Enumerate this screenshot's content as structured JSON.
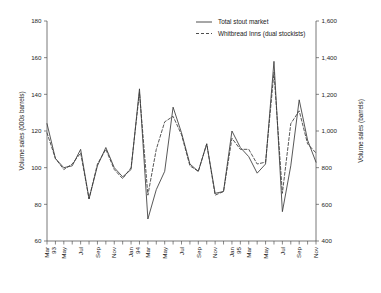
{
  "chart_data": {
    "type": "line",
    "title": "",
    "xlabel": "",
    "ylabel": "Volume sales (000s barrels)",
    "y2label": "Volume sales (barrels)",
    "ylim": [
      60,
      180
    ],
    "y2lim": [
      400,
      1600
    ],
    "yticks": [
      "60",
      "80",
      "100",
      "120",
      "140",
      "160",
      "180"
    ],
    "ytick_values": [
      60,
      80,
      100,
      120,
      140,
      160,
      180
    ],
    "y2ticks": [
      "400",
      "600",
      "800",
      "1,000",
      "1,200",
      "1,400",
      "1,600"
    ],
    "y2tick_values": [
      400,
      600,
      800,
      1000,
      1200,
      1400,
      1600
    ],
    "grid": false,
    "legend_position": "top-right",
    "x": [
      "Mar 93",
      "Apr 93",
      "May 93",
      "Jun 93",
      "Jul 93",
      "Aug 93",
      "Sep 93",
      "Oct 93",
      "Nov 93",
      "Dec 93",
      "Jan 94",
      "Feb 94",
      "Mar 94",
      "Apr 94",
      "May 94",
      "Jun 94",
      "Jul 94",
      "Aug 94",
      "Sep 94",
      "Oct 94",
      "Nov 94",
      "Dec 94",
      "Jan 95",
      "Feb 95",
      "Mar 95",
      "Apr 95",
      "May 95",
      "Jun 95",
      "Jul 95",
      "Aug 95",
      "Sep 95",
      "Oct 95",
      "Nov 95"
    ],
    "xtick_labels": [
      {
        "index": 0,
        "line1": "Mar",
        "line2": "93"
      },
      {
        "index": 2,
        "line1": "May",
        "line2": ""
      },
      {
        "index": 4,
        "line1": "Jul",
        "line2": ""
      },
      {
        "index": 6,
        "line1": "Sep",
        "line2": ""
      },
      {
        "index": 8,
        "line1": "Nov",
        "line2": ""
      },
      {
        "index": 10,
        "line1": "Jan",
        "line2": "94"
      },
      {
        "index": 12,
        "line1": "Mar",
        "line2": ""
      },
      {
        "index": 14,
        "line1": "May",
        "line2": ""
      },
      {
        "index": 16,
        "line1": "Jul",
        "line2": ""
      },
      {
        "index": 18,
        "line1": "Sep",
        "line2": ""
      },
      {
        "index": 20,
        "line1": "Nov",
        "line2": ""
      },
      {
        "index": 22,
        "line1": "Jan",
        "line2": "95"
      },
      {
        "index": 24,
        "line1": "Mar",
        "line2": ""
      },
      {
        "index": 26,
        "line1": "May",
        "line2": ""
      },
      {
        "index": 28,
        "line1": "Jul",
        "line2": ""
      },
      {
        "index": 30,
        "line1": "Sep",
        "line2": ""
      },
      {
        "index": 32,
        "line1": "Nov",
        "line2": ""
      }
    ],
    "series": [
      {
        "name": "Total stout market",
        "style": "solid",
        "color": "#3a3a3a",
        "values": [
          124,
          105,
          100,
          101,
          110,
          83,
          101,
          111,
          100,
          95,
          99,
          143,
          72,
          88,
          98,
          133,
          119,
          102,
          98,
          113,
          86,
          87,
          120,
          111,
          106,
          97,
          102,
          158,
          76,
          101,
          137,
          115,
          103
        ]
      },
      {
        "name": "Whitbread Inns (dual stockists)",
        "style": "dashed",
        "color": "#3a3a3a",
        "values": [
          119,
          105,
          99,
          102,
          108,
          83,
          102,
          110,
          99,
          94,
          100,
          141,
          85,
          110,
          125,
          128,
          118,
          101,
          98,
          113,
          85,
          87,
          116,
          110,
          110,
          102,
          103,
          152,
          86,
          124,
          131,
          113,
          108
        ]
      }
    ],
    "legend": [
      {
        "label": "Total stout market",
        "style": "solid"
      },
      {
        "label": "Whitbread Inns (dual stockists)",
        "style": "dashed"
      }
    ]
  }
}
